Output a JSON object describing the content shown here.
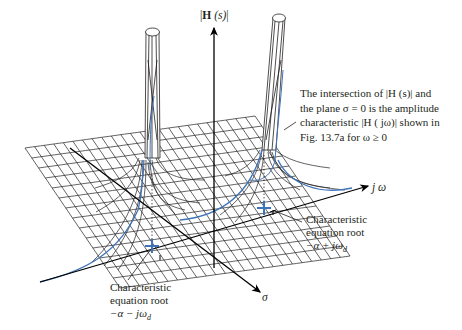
{
  "figure": {
    "type": "3d-surface-plot",
    "axes": {
      "vertical": {
        "label_prefix": "|",
        "label_bold": "H",
        "label_arg": " (s)",
        "label_suffix": "|"
      },
      "imaginary": {
        "label": "j ω"
      },
      "real": {
        "label": "σ"
      }
    },
    "annotations": {
      "intersection_note": {
        "lines": [
          "The intersection of |H (s)| and",
          "the plane σ = 0 is the amplitude",
          "characteristic |H ( jω)| shown in",
          "Fig. 13.7a for ω ≥ 0"
        ]
      },
      "root_upper": {
        "line1": "Characteristic",
        "line2": "equation root",
        "line3_main": "−α + jω",
        "line3_sub": "d"
      },
      "root_lower": {
        "line1": "Characteristic",
        "line2": "equation root",
        "line3_main": "−α − jω",
        "line3_sub": "d"
      }
    },
    "colors": {
      "mesh": "#231f20",
      "highlight_curve": "#3f74b8",
      "root_marker": "#3f74b8",
      "axes": "#000000"
    }
  }
}
